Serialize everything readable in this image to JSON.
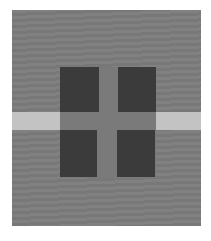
{
  "figure": {
    "colors": {
      "page_background": "#ffffff",
      "field_gray": "#7c7c7c",
      "light_band": "#c3c3c3",
      "center_cross_gray": "#7a7a7a",
      "dark_squares": "#3b3b3b"
    },
    "elements": [
      {
        "name": "gray-field",
        "x": 12,
        "y": 10,
        "width": 189,
        "height": 216
      },
      {
        "name": "light-band",
        "x": 12,
        "y": 112,
        "width": 189,
        "height": 18
      },
      {
        "name": "dark-square-top-left",
        "x": 60,
        "y": 67,
        "width": 39,
        "height": 45
      },
      {
        "name": "dark-square-top-right",
        "x": 118,
        "y": 67,
        "width": 38,
        "height": 45
      },
      {
        "name": "dark-square-bottom-left",
        "x": 60,
        "y": 130,
        "width": 37,
        "height": 47
      },
      {
        "name": "dark-square-bottom-right",
        "x": 117,
        "y": 130,
        "width": 38,
        "height": 47
      },
      {
        "name": "center-gray-cross",
        "x": 60,
        "y": 67,
        "width": 96,
        "height": 110
      }
    ]
  }
}
